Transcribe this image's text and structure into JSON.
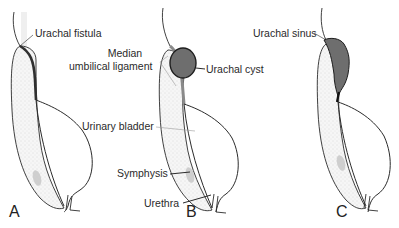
{
  "figure": {
    "panels": [
      {
        "letter": "A",
        "title": "Urachal fistula"
      },
      {
        "letter": "B",
        "title": "Urachal cyst"
      },
      {
        "letter": "C",
        "title": "Urachal sinus"
      }
    ],
    "labels": {
      "urachal_fistula": "Urachal fistula",
      "median_line1": "Median",
      "median_line2": "umbilical ligament",
      "urachal_cyst": "Urachal cyst",
      "urachal_sinus": "Urachal sinus",
      "urinary_bladder": "Urinary bladder",
      "symphysis": "Symphysis",
      "urethra": "Urethra"
    },
    "colors": {
      "outline": "#2b2b2b",
      "lesion_fill": "#6e6e6e",
      "fistula": "#303030",
      "stipple": "#e8e8e8",
      "symphysis": "#c8c8c8",
      "leader": "#9a9a9a"
    }
  }
}
